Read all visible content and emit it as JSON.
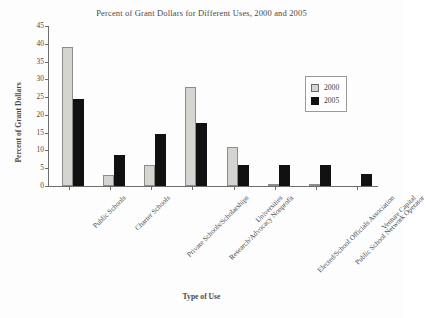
{
  "chart_data": {
    "type": "bar",
    "title": "Percent of Grant Dollars for Different Uses, 2000 and 2005",
    "xlabel": "Type of Use",
    "ylabel": "Percent of Grant Dollars",
    "ylim": [
      0,
      45
    ],
    "yticks": [
      0,
      5,
      10,
      15,
      20,
      25,
      30,
      35,
      40,
      45
    ],
    "grid": false,
    "legend_position": "upper right",
    "categories": [
      "Public Schools",
      "Charter Schools",
      "Private Schools/Scholarships",
      "Research/Advocacy Nonprofit",
      "Universities",
      "Elected/School Officials Association",
      "Public School Network Operator",
      "Venture Capital"
    ],
    "series": [
      {
        "name": "2000",
        "color": "#d4d4d0",
        "values": [
          39,
          3,
          6,
          27.8,
          11,
          0.5,
          0.5,
          0
        ]
      },
      {
        "name": "2005",
        "color": "#111111",
        "values": [
          24.4,
          8.7,
          14.7,
          17.7,
          6,
          6,
          6,
          3.5
        ]
      }
    ]
  },
  "legend": {
    "entries": [
      {
        "label": "2000"
      },
      {
        "label": "2005"
      }
    ]
  }
}
